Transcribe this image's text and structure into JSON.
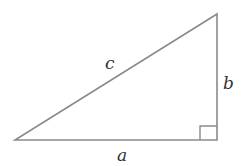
{
  "diagram": {
    "type": "right-triangle",
    "labels": {
      "hypotenuse": "c",
      "vertical_leg": "b",
      "horizontal_leg": "a"
    },
    "right_angle_marker": true,
    "colors": {
      "stroke": "#8a8a8a",
      "text": "#333333",
      "background": "#ffffff"
    }
  }
}
